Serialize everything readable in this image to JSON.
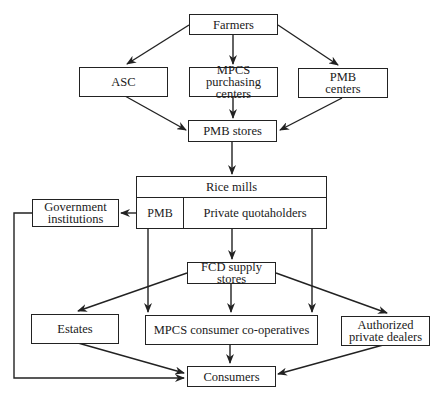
{
  "diagram": {
    "type": "flowchart",
    "nodes": {
      "farmers": "Farmers",
      "asc": "ASC",
      "mpcs_purchasing": "MPCS purchasing centers",
      "pmb_centers": "PMB centers",
      "pmb_stores": "PMB stores",
      "rice_mills": {
        "title": "Rice mills",
        "left_cell": "PMB",
        "right_cell": "Private quotaholders"
      },
      "government_institutions": "Government institutions",
      "fcd_supply_stores": "FCD supply stores",
      "estates": "Estates",
      "mpcs_consumer": "MPCS consumer co-operatives",
      "authorized_dealers": "Authorized private dealers",
      "consumers": "Consumers"
    },
    "edges": [
      {
        "from": "Farmers",
        "to": "ASC"
      },
      {
        "from": "Farmers",
        "to": "MPCS purchasing centers"
      },
      {
        "from": "Farmers",
        "to": "PMB centers"
      },
      {
        "from": "ASC",
        "to": "PMB stores"
      },
      {
        "from": "MPCS purchasing centers",
        "to": "PMB stores"
      },
      {
        "from": "PMB centers",
        "to": "PMB stores"
      },
      {
        "from": "PMB stores",
        "to": "Rice mills"
      },
      {
        "from": "Rice mills (PMB)",
        "to": "Government institutions"
      },
      {
        "from": "Rice mills",
        "to": "FCD supply stores"
      },
      {
        "from": "Rice mills (PMB)",
        "to": "MPCS consumer co-operatives"
      },
      {
        "from": "Rice mills (Private quotaholders)",
        "to": "MPCS consumer co-operatives"
      },
      {
        "from": "FCD supply stores",
        "to": "Estates"
      },
      {
        "from": "FCD supply stores",
        "to": "MPCS consumer co-operatives"
      },
      {
        "from": "FCD supply stores",
        "to": "Authorized private dealers"
      },
      {
        "from": "Estates",
        "to": "Consumers"
      },
      {
        "from": "MPCS consumer co-operatives",
        "to": "Consumers"
      },
      {
        "from": "Authorized private dealers",
        "to": "Consumers"
      },
      {
        "from": "Government institutions",
        "to": "Consumers"
      }
    ],
    "colors": {
      "line": "#222222",
      "background": "#ffffff"
    }
  }
}
